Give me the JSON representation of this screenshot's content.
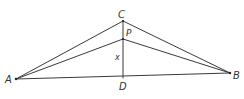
{
  "diagram": {
    "type": "geometry-triangle",
    "colors": {
      "line": "#3a3a3a",
      "text": "#333333",
      "background": "#ffffff"
    },
    "points": {
      "A": {
        "label": "A",
        "x": 16,
        "y": 79
      },
      "B": {
        "label": "B",
        "x": 230,
        "y": 73
      },
      "C": {
        "label": "C",
        "x": 123,
        "y": 21
      },
      "P": {
        "label": "P",
        "x": 123,
        "y": 39
      },
      "D": {
        "label": "D",
        "x": 123,
        "y": 78
      }
    },
    "segments": [
      {
        "from": "A",
        "to": "C"
      },
      {
        "from": "C",
        "to": "B"
      },
      {
        "from": "A",
        "to": "B"
      },
      {
        "from": "A",
        "to": "P"
      },
      {
        "from": "P",
        "to": "B"
      },
      {
        "from": "C",
        "to": "D"
      }
    ],
    "labels": {
      "A": "A",
      "B": "B",
      "C": "C",
      "P": "P",
      "D": "D",
      "x": "x"
    }
  }
}
